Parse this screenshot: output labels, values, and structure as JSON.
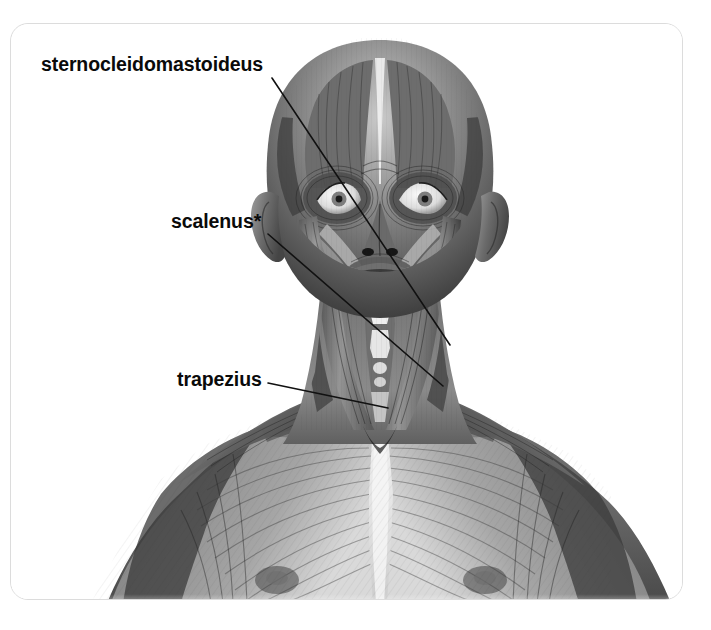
{
  "figure": {
    "kind": "anatomical-illustration",
    "style": "grayscale pencil/airbrush rendering, ecorche (skin removed)",
    "background_color": "#ffffff",
    "card": {
      "border_color": "#dcdcdc",
      "corner_radius": "18px",
      "fill": "#ffffff"
    }
  },
  "labels": [
    {
      "id": "sternocleidomastoideus",
      "text": "sternocleidomastoideus",
      "color": "#0a0a0a",
      "leader": {
        "x1": 272,
        "y1": 78,
        "x2": 450,
        "y2": 345
      }
    },
    {
      "id": "scalenus",
      "text": "scalenus*",
      "color": "#0a0a0a",
      "leader": {
        "x1": 268,
        "y1": 234,
        "x2": 443,
        "y2": 386
      }
    },
    {
      "id": "trapezius",
      "text": "trapezius",
      "color": "#0a0a0a",
      "leader": {
        "x1": 268,
        "y1": 383,
        "x2": 388,
        "y2": 408
      }
    }
  ],
  "leader_line": {
    "color": "#111111",
    "width": 1.6
  },
  "annotations": {
    "asterisk_note": "*",
    "asterisk_meaning_shown": false
  }
}
